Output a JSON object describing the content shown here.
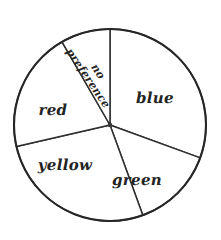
{
  "figure": {
    "background_color": "#ffffff",
    "stroke_color": "#2e2e2e",
    "outline_color": "#262626",
    "label_color": "#242424"
  },
  "chart_data": {
    "type": "pie",
    "title": "",
    "subtitle": "",
    "xlabel": "",
    "ylabel": "",
    "grid": false,
    "legend": false,
    "legend_position": "none",
    "labels_inside_slices": true,
    "style": "hand-drawn",
    "units": "degrees",
    "center_px": [
      110,
      125
    ],
    "radius_px": 96,
    "start_angle_deg_from_top": 0,
    "direction": "clockwise",
    "categories": [
      "blue",
      "green",
      "yellow",
      "red",
      "no preference"
    ],
    "angles_deg": [
      110,
      50,
      97,
      73,
      30
    ],
    "values": [
      110,
      50,
      97,
      73,
      30
    ],
    "percentages": [
      30.6,
      13.9,
      26.9,
      20.3,
      8.3
    ],
    "slices": [
      {
        "label": "blue",
        "start_deg": 0,
        "end_deg": 110,
        "angle_deg": 110,
        "percent": 30.6,
        "fill": "#ffffff",
        "label_x_px": 155,
        "label_y_px": 98,
        "label_rotation_deg": 0,
        "label_size": "normal"
      },
      {
        "label": "green",
        "start_deg": 110,
        "end_deg": 160,
        "angle_deg": 50,
        "percent": 13.9,
        "fill": "#ffffff",
        "label_x_px": 137,
        "label_y_px": 180,
        "label_rotation_deg": 0,
        "label_size": "normal"
      },
      {
        "label": "yellow",
        "start_deg": 160,
        "end_deg": 257,
        "angle_deg": 97,
        "percent": 26.9,
        "fill": "#ffffff",
        "label_x_px": 65,
        "label_y_px": 165,
        "label_rotation_deg": 0,
        "label_size": "normal"
      },
      {
        "label": "red",
        "start_deg": 257,
        "end_deg": 330,
        "angle_deg": 73,
        "percent": 20.3,
        "fill": "#ffffff",
        "label_x_px": 53,
        "label_y_px": 110,
        "label_rotation_deg": 0,
        "label_size": "normal"
      },
      {
        "label": "no preference",
        "line1": "no",
        "line2": "preference",
        "start_deg": 330,
        "end_deg": 360,
        "angle_deg": 30,
        "percent": 8.3,
        "fill": "#ffffff",
        "label_x_px": 93,
        "label_y_px": 75,
        "label_rotation_deg": 56,
        "label_size": "small"
      }
    ]
  }
}
